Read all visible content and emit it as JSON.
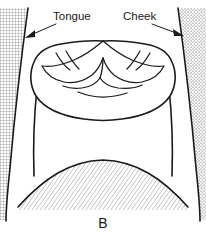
{
  "figure": {
    "panel_label": "B",
    "labels": [
      {
        "id": "tongue",
        "text": "Tongue",
        "points_to": "left-crosshatch-region"
      },
      {
        "id": "cheek",
        "text": "Cheek",
        "points_to": "right-stipple-region"
      }
    ],
    "regions": [
      {
        "id": "tongue-region",
        "name": "tongue",
        "fill_pattern": "crosshatch-grid",
        "side": "left"
      },
      {
        "id": "cheek-region",
        "name": "cheek",
        "fill_pattern": "stipple-dots",
        "side": "right"
      },
      {
        "id": "tooth-region",
        "name": "molar-occlusal-surface",
        "fill_pattern": "none",
        "side": "center-top"
      },
      {
        "id": "lower-arch-region",
        "name": "lower-arch",
        "fill_pattern": "diagonal-hatch",
        "side": "center-bottom"
      }
    ],
    "colors": {
      "ink": "#1a1a1a",
      "pattern": "#8c8c8c",
      "background": "#ffffff"
    }
  }
}
